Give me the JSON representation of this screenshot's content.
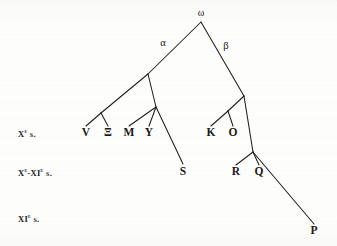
{
  "figure": {
    "kind": "stemma-codicum",
    "width": 337,
    "height": 246,
    "background_color": "#fdfdfc",
    "ink_color": "#201e1c"
  },
  "era_labels": [
    {
      "id": "era-10c",
      "text_html": "X<sup>e</sup> s.",
      "plain": "Xe s.",
      "x": 18,
      "y": 133
    },
    {
      "id": "era-10-11c",
      "text_html": "X<sup>e</sup>-XI<sup>e</sup> s.",
      "plain": "Xe-XIe s.",
      "x": 18,
      "y": 172
    },
    {
      "id": "era-11c",
      "text_html": "XI<sup>e</sup> s.",
      "plain": "XIe s.",
      "x": 18,
      "y": 218
    }
  ],
  "nodes": [
    {
      "id": "omega",
      "label": "ω",
      "kind": "archetype",
      "x": 201,
      "y": 13
    },
    {
      "id": "alpha",
      "label": "α",
      "kind": "hyparchetype",
      "x": 163,
      "y": 43
    },
    {
      "id": "beta",
      "label": "β",
      "kind": "hyparchetype",
      "x": 226,
      "y": 46
    },
    {
      "id": "V",
      "label": "V",
      "kind": "witness",
      "x": 86,
      "y": 133
    },
    {
      "id": "Xi",
      "label": "Ξ",
      "kind": "witness",
      "x": 108,
      "y": 133
    },
    {
      "id": "M",
      "label": "M",
      "kind": "witness",
      "x": 129,
      "y": 133
    },
    {
      "id": "Y",
      "label": "Y",
      "kind": "witness",
      "x": 149,
      "y": 133
    },
    {
      "id": "K",
      "label": "K",
      "kind": "witness",
      "x": 211,
      "y": 133
    },
    {
      "id": "O",
      "label": "O",
      "kind": "witness",
      "x": 233,
      "y": 133
    },
    {
      "id": "S",
      "label": "S",
      "kind": "witness",
      "x": 183,
      "y": 172
    },
    {
      "id": "R",
      "label": "R",
      "kind": "witness",
      "x": 236,
      "y": 172
    },
    {
      "id": "Q",
      "label": "Q",
      "kind": "witness",
      "x": 259,
      "y": 172
    },
    {
      "id": "P",
      "label": "P",
      "kind": "witness",
      "x": 314,
      "y": 231
    }
  ],
  "edges": [
    {
      "id": "edge-omega-alpha",
      "from": "omega",
      "to": "node-alpha-split",
      "x1": 201,
      "y1": 22,
      "x2": 148,
      "y2": 74
    },
    {
      "id": "edge-omega-beta",
      "from": "omega",
      "to": "node-beta-split",
      "x1": 201,
      "y1": 22,
      "x2": 244,
      "y2": 96
    },
    {
      "id": "edge-alpha-to-v-xi-node",
      "from": "node-alpha-split",
      "to": "node-v-xi",
      "x1": 148,
      "y1": 74,
      "x2": 101,
      "y2": 113
    },
    {
      "id": "edge-v-xi-to-v",
      "from": "node-v-xi",
      "to": "V",
      "x1": 101,
      "y1": 113,
      "x2": 86,
      "y2": 126
    },
    {
      "id": "edge-v-xi-to-xi",
      "from": "node-v-xi",
      "to": "Xi",
      "x1": 101,
      "y1": 113,
      "x2": 108,
      "y2": 126
    },
    {
      "id": "edge-alpha-to-m-y-node",
      "from": "node-alpha-split",
      "to": "node-m-y",
      "x1": 148,
      "y1": 74,
      "x2": 156,
      "y2": 107
    },
    {
      "id": "edge-m-y-to-m",
      "from": "node-m-y",
      "to": "M",
      "x1": 156,
      "y1": 107,
      "x2": 129,
      "y2": 126
    },
    {
      "id": "edge-m-y-to-y",
      "from": "node-m-y",
      "to": "Y",
      "x1": 156,
      "y1": 107,
      "x2": 149,
      "y2": 126
    },
    {
      "id": "edge-m-y-to-s",
      "from": "node-m-y",
      "to": "S",
      "x1": 156,
      "y1": 107,
      "x2": 183,
      "y2": 164
    },
    {
      "id": "edge-beta-to-k-o-node",
      "from": "node-beta-split",
      "to": "node-k-o",
      "x1": 244,
      "y1": 96,
      "x2": 228,
      "y2": 111
    },
    {
      "id": "edge-k-o-to-k",
      "from": "node-k-o",
      "to": "K",
      "x1": 228,
      "y1": 111,
      "x2": 211,
      "y2": 126
    },
    {
      "id": "edge-k-o-to-o",
      "from": "node-k-o",
      "to": "O",
      "x1": 228,
      "y1": 111,
      "x2": 233,
      "y2": 126
    },
    {
      "id": "edge-beta-to-r-q-node",
      "from": "node-beta-split",
      "to": "node-r-q",
      "x1": 244,
      "y1": 96,
      "x2": 253,
      "y2": 152
    },
    {
      "id": "edge-r-q-to-r",
      "from": "node-r-q",
      "to": "R",
      "x1": 253,
      "y1": 152,
      "x2": 236,
      "y2": 165
    },
    {
      "id": "edge-r-q-to-q",
      "from": "node-r-q",
      "to": "Q",
      "x1": 253,
      "y1": 152,
      "x2": 259,
      "y2": 165
    },
    {
      "id": "edge-r-q-to-p",
      "from": "node-r-q",
      "to": "P",
      "x1": 253,
      "y1": 152,
      "x2": 314,
      "y2": 224
    }
  ]
}
